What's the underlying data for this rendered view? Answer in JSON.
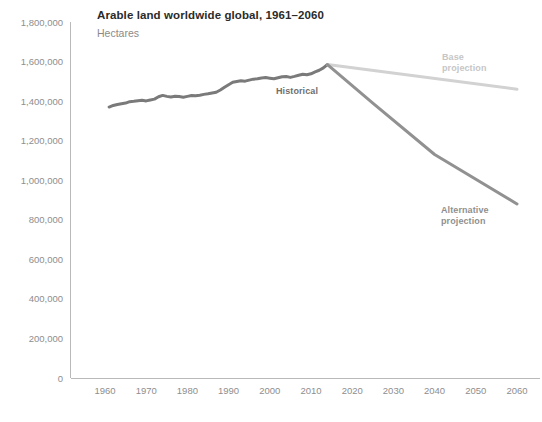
{
  "chart_data": {
    "type": "line",
    "title": "Arable land worldwide global, 1961–2060",
    "subtitle": "Hectares",
    "xlabel": "",
    "ylabel": "Hectares",
    "xlim": [
      1955,
      2063
    ],
    "ylim": [
      0,
      1800000
    ],
    "grid": false,
    "legend": "inline-annotations",
    "y_ticks": [
      0,
      200000,
      400000,
      600000,
      800000,
      1000000,
      1200000,
      1400000,
      1600000,
      1800000
    ],
    "y_tick_labels": [
      "0",
      "200,000",
      "400,000",
      "600,000",
      "800,000",
      "1,000,000",
      "1,200,000",
      "1,400,000",
      "1,600,000",
      "1,800,000"
    ],
    "x_ticks": [
      1960,
      1970,
      1980,
      1990,
      2000,
      2010,
      2020,
      2030,
      2040,
      2050,
      2060
    ],
    "x_tick_labels": [
      "1960",
      "1970",
      "1980",
      "1990",
      "2000",
      "2010",
      "2020",
      "2030",
      "2040",
      "2050",
      "2060"
    ],
    "series": [
      {
        "name": "Historical",
        "color": "#7a7a7a",
        "label_text": "Historical",
        "x": [
          1961,
          1962,
          1963,
          1964,
          1965,
          1966,
          1967,
          1968,
          1969,
          1970,
          1971,
          1972,
          1973,
          1974,
          1975,
          1976,
          1977,
          1978,
          1979,
          1980,
          1981,
          1982,
          1983,
          1984,
          1985,
          1986,
          1987,
          1988,
          1989,
          1990,
          1991,
          1992,
          1993,
          1994,
          1995,
          1996,
          1997,
          1998,
          1999,
          2000,
          2001,
          2002,
          2003,
          2004,
          2005,
          2006,
          2007,
          2008,
          2009,
          2010,
          2011,
          2012,
          2013,
          2014
        ],
        "values": [
          1370000,
          1378000,
          1383000,
          1387000,
          1390000,
          1397000,
          1399000,
          1402000,
          1404000,
          1401000,
          1406000,
          1410000,
          1422000,
          1429000,
          1424000,
          1421000,
          1425000,
          1423000,
          1420000,
          1424000,
          1428000,
          1427000,
          1430000,
          1434000,
          1437000,
          1441000,
          1445000,
          1456000,
          1470000,
          1483000,
          1495000,
          1499000,
          1503000,
          1501000,
          1506000,
          1511000,
          1513000,
          1517000,
          1519000,
          1516000,
          1513000,
          1518000,
          1523000,
          1524000,
          1520000,
          1525000,
          1531000,
          1536000,
          1533000,
          1538000,
          1548000,
          1556000,
          1568000,
          1585000
        ]
      },
      {
        "name": "Base projection",
        "color": "#d2d2d2",
        "label_text": "Base\nprojection",
        "x": [
          2014,
          2060
        ],
        "values": [
          1585000,
          1460000
        ]
      },
      {
        "name": "Alternative projection",
        "color": "#919191",
        "label_text": "Alternative\nprojection",
        "x": [
          2014,
          2025,
          2040,
          2060
        ],
        "values": [
          1585000,
          1390000,
          1130000,
          880000
        ]
      }
    ],
    "annotations": [
      {
        "name": "historical-label",
        "text": "Historical",
        "x_px": 297,
        "y_px": 94
      },
      {
        "name": "base-projection-label",
        "line1": "Base",
        "line2": "projection",
        "x_px": 442,
        "y_px": 60
      },
      {
        "name": "alternative-projection-label",
        "line1": "Alternative",
        "line2": "projection",
        "x_px": 441,
        "y_px": 213
      }
    ]
  },
  "footer": {
    "note": ""
  }
}
